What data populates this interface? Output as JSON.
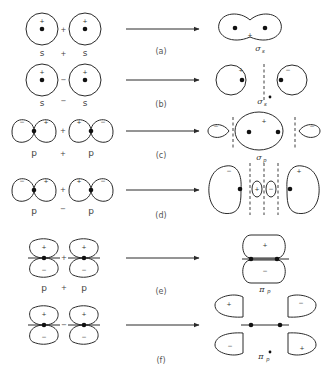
{
  "figure": {
    "rows": [
      {
        "tag": "(a)",
        "left": {
          "orbital_1": "s",
          "operator": "+",
          "orbital_2": "s",
          "sign_1": "+",
          "sign_2": "+",
          "join": "+"
        },
        "right": {
          "mo_symbol": "σ",
          "mo_sub": "s",
          "signs": [
            "+"
          ]
        }
      },
      {
        "tag": "(b)",
        "left": {
          "orbital_1": "s",
          "operator": "−",
          "orbital_2": "s",
          "sign_1": "+",
          "sign_2": "+",
          "join": "−"
        },
        "right": {
          "mo_symbol": "σ",
          "mo_sub": "s",
          "star": "•",
          "signs": [
            "+",
            "−"
          ]
        }
      },
      {
        "tag": "(c)",
        "left": {
          "orbital_1": "p",
          "operator": "+",
          "orbital_2": "p",
          "lobes": [
            "−",
            "+",
            "+",
            "−"
          ],
          "join": "+"
        },
        "right": {
          "mo_symbol": "σ",
          "mo_sub": "p",
          "signs": [
            "−",
            "+",
            "−"
          ]
        }
      },
      {
        "tag": "(d)",
        "left": {
          "orbital_1": "p",
          "operator": "−",
          "orbital_2": "p",
          "lobes": [
            "−",
            "+",
            "+",
            "−"
          ],
          "join": "+"
        },
        "right": {
          "signs": [
            "−",
            "+",
            "−",
            "+"
          ]
        }
      },
      {
        "tag": "(e)",
        "left": {
          "orbital_1": "p",
          "operator": "+",
          "orbital_2": "p",
          "lobes": [
            "+",
            "+",
            "−",
            "−"
          ],
          "join": "+"
        },
        "right": {
          "mo_symbol": "π",
          "mo_sub": "p",
          "signs": [
            "+",
            "−"
          ]
        }
      },
      {
        "tag": "(f)",
        "left": {
          "lobes": [
            "+",
            "+",
            "−",
            "−"
          ],
          "join": "−"
        },
        "right": {
          "mo_symbol": "π",
          "mo_sub": "p",
          "star": "•",
          "signs": [
            "+",
            "−",
            "−",
            "+"
          ]
        }
      }
    ]
  }
}
